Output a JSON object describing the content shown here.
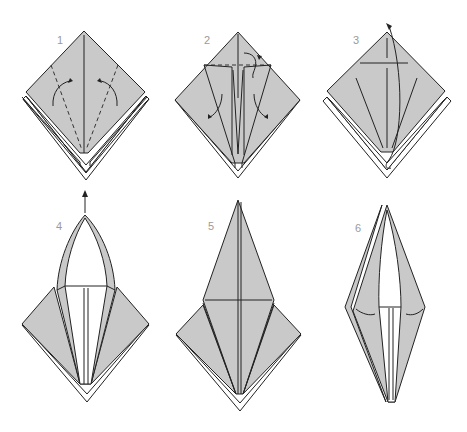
{
  "diagram": {
    "colors": {
      "paper": "#c9c9c9",
      "outline": "#222222",
      "background": "#ffffff",
      "label": "#9a9a9a"
    },
    "steps": [
      {
        "number": "1",
        "instruction_graphic": "fold lower edges to center crease (valley folds, dashed)"
      },
      {
        "number": "2",
        "instruction_graphic": "fold top triangle down along dashed line, then unfold flaps"
      },
      {
        "number": "3",
        "instruction_graphic": "lift bottom point up along creases (petal fold)"
      },
      {
        "number": "4",
        "instruction_graphic": "petal fold in progress, point pulled upward"
      },
      {
        "number": "5",
        "instruction_graphic": "completed petal fold (bird base front)"
      },
      {
        "number": "6",
        "instruction_graphic": "repeat on reverse side, flaps narrowed"
      }
    ]
  }
}
